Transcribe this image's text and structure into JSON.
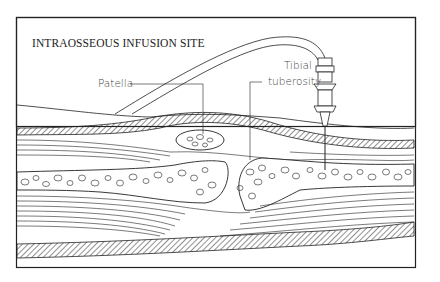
{
  "figure": {
    "title": "INTRAOSSEOUS INFUSION SITE",
    "labels": {
      "patella": "Patella",
      "tibial_line1": "Tibial",
      "tibial_line2": "tuberosity"
    }
  },
  "colors": {
    "line": "#222222",
    "background": "#ffffff"
  }
}
